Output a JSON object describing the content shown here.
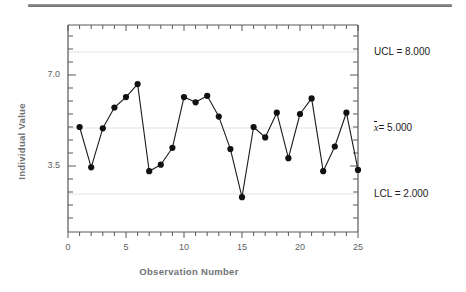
{
  "chart_data": {
    "type": "line",
    "title": "",
    "subtitle": "",
    "xlabel": "Observation Number",
    "ylabel": "Individual Value",
    "x": [
      1,
      2,
      3,
      4,
      5,
      6,
      7,
      8,
      9,
      10,
      11,
      12,
      13,
      14,
      15,
      16,
      17,
      18,
      19,
      20,
      21,
      22,
      23,
      24,
      25
    ],
    "values": [
      5.0,
      3.45,
      4.95,
      5.75,
      6.15,
      6.65,
      3.3,
      3.55,
      4.2,
      6.15,
      5.95,
      6.2,
      5.4,
      4.15,
      2.3,
      5.0,
      4.6,
      5.55,
      3.8,
      5.5,
      6.1,
      3.3,
      4.25,
      5.55,
      3.35
    ],
    "series": [
      {
        "name": "Individual Value",
        "values": [
          5.0,
          3.45,
          4.95,
          5.75,
          6.15,
          6.65,
          3.3,
          3.55,
          4.2,
          6.15,
          5.95,
          6.2,
          5.4,
          4.15,
          2.3,
          5.0,
          4.6,
          5.55,
          3.8,
          5.5,
          6.1,
          3.3,
          4.25,
          5.55,
          3.35
        ]
      }
    ],
    "xlim": [
      0,
      26
    ],
    "ylim": [
      0.9,
      9.1
    ],
    "xticks": [
      0,
      5,
      10,
      15,
      20,
      25
    ],
    "xtick_labels": [
      "0",
      "5",
      "10",
      "15",
      "20",
      "25"
    ],
    "yticks": [
      3.5,
      7.0
    ],
    "ytick_labels": [
      "3.5",
      "7.0"
    ],
    "grid": true,
    "legend": "none",
    "marker": "filled-circle",
    "reference_lines": [
      {
        "name": "ucl",
        "value": 8.0,
        "label": "UCL = 8.000"
      },
      {
        "name": "center",
        "value": 5.0,
        "label": "= 5.000",
        "symbol": "x"
      },
      {
        "name": "lcl",
        "value": 2.0,
        "label": "LCL = 2.000"
      }
    ],
    "annotations": [
      {
        "name": "ucl-annotation",
        "text": "UCL = 8.000"
      },
      {
        "name": "center-annotation",
        "text": "= 5.000"
      },
      {
        "name": "lcl-annotation",
        "text": "LCL = 2.000"
      }
    ],
    "colors": {
      "line": "#1b1b1b",
      "marker": "#111111",
      "grid": "#ececed",
      "axis": "#4a4d50",
      "tick_text": "#5d6164",
      "axis_title": "#6f7376",
      "background": "#ffffff"
    }
  },
  "labels": {
    "ucl": "UCL = 8.000",
    "center_symbol": "x",
    "center_value": "= 5.000",
    "lcl": "LCL = 2.000",
    "ytick_70": "7.0",
    "ytick_35": "3.5",
    "xtick_0": "0",
    "xtick_5": "5",
    "xtick_10": "10",
    "xtick_15": "15",
    "xtick_20": "20",
    "xtick_25": "25",
    "xaxis_title": "Observation Number",
    "yaxis_title": "Individual Value"
  }
}
